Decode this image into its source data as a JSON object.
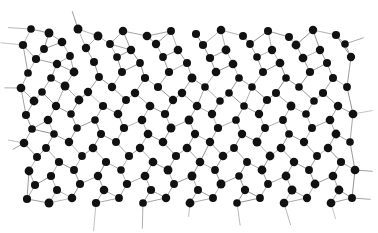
{
  "figure": {
    "kind": "structure-diagram",
    "caption": "",
    "background_color": "#ffffff",
    "atom_color": "#111111",
    "bond_color": "#8c8c8c",
    "atom_radius": 4.1,
    "bond_width": 0.75,
    "canvas": {
      "width": 378,
      "height": 233
    },
    "plot_area": {
      "x": 18,
      "y": 14,
      "width": 340,
      "height": 198
    },
    "atom_count": 196,
    "bond_count": 268,
    "mean_coordination": "3",
    "atoms": [
      [
        31,
        29
      ],
      [
        49,
        33
      ],
      [
        78,
        29
      ],
      [
        98,
        36
      ],
      [
        123,
        31
      ],
      [
        147,
        36
      ],
      [
        171,
        31
      ],
      [
        196,
        34
      ],
      [
        221,
        30
      ],
      [
        243,
        36
      ],
      [
        268,
        31
      ],
      [
        289,
        37
      ],
      [
        313,
        30
      ],
      [
        336,
        35
      ],
      [
        23,
        45
      ],
      [
        44,
        49
      ],
      [
        62,
        42
      ],
      [
        86,
        48
      ],
      [
        110,
        44
      ],
      [
        131,
        50
      ],
      [
        156,
        44
      ],
      [
        178,
        50
      ],
      [
        203,
        45
      ],
      [
        226,
        50
      ],
      [
        250,
        44
      ],
      [
        272,
        50
      ],
      [
        296,
        45
      ],
      [
        320,
        50
      ],
      [
        345,
        44
      ],
      [
        36,
        59
      ],
      [
        57,
        64
      ],
      [
        70,
        56
      ],
      [
        94,
        62
      ],
      [
        117,
        57
      ],
      [
        140,
        63
      ],
      [
        163,
        57
      ],
      [
        187,
        63
      ],
      [
        210,
        58
      ],
      [
        233,
        64
      ],
      [
        257,
        57
      ],
      [
        280,
        63
      ],
      [
        303,
        58
      ],
      [
        327,
        63
      ],
      [
        351,
        57
      ],
      [
        28,
        73
      ],
      [
        51,
        78
      ],
      [
        74,
        72
      ],
      [
        99,
        77
      ],
      [
        122,
        72
      ],
      [
        145,
        78
      ],
      [
        169,
        72
      ],
      [
        192,
        78
      ],
      [
        216,
        72
      ],
      [
        239,
        78
      ],
      [
        263,
        72
      ],
      [
        286,
        78
      ],
      [
        310,
        72
      ],
      [
        333,
        78
      ],
      [
        21,
        88
      ],
      [
        42,
        92
      ],
      [
        65,
        86
      ],
      [
        88,
        92
      ],
      [
        112,
        87
      ],
      [
        135,
        93
      ],
      [
        158,
        87
      ],
      [
        182,
        93
      ],
      [
        205,
        87
      ],
      [
        229,
        93
      ],
      [
        252,
        87
      ],
      [
        276,
        93
      ],
      [
        299,
        87
      ],
      [
        323,
        93
      ],
      [
        347,
        87
      ],
      [
        34,
        101
      ],
      [
        56,
        106
      ],
      [
        79,
        100
      ],
      [
        103,
        106
      ],
      [
        126,
        100
      ],
      [
        150,
        106
      ],
      [
        173,
        100
      ],
      [
        197,
        106
      ],
      [
        220,
        101
      ],
      [
        244,
        106
      ],
      [
        267,
        100
      ],
      [
        291,
        106
      ],
      [
        314,
        101
      ],
      [
        338,
        106
      ],
      [
        26,
        115
      ],
      [
        48,
        120
      ],
      [
        71,
        114
      ],
      [
        95,
        120
      ],
      [
        118,
        114
      ],
      [
        142,
        120
      ],
      [
        165,
        114
      ],
      [
        189,
        120
      ],
      [
        212,
        114
      ],
      [
        236,
        120
      ],
      [
        259,
        114
      ],
      [
        283,
        120
      ],
      [
        306,
        114
      ],
      [
        330,
        120
      ],
      [
        353,
        114
      ],
      [
        32,
        129
      ],
      [
        54,
        134
      ],
      [
        77,
        128
      ],
      [
        101,
        134
      ],
      [
        124,
        128
      ],
      [
        148,
        134
      ],
      [
        171,
        128
      ],
      [
        195,
        134
      ],
      [
        218,
        128
      ],
      [
        242,
        134
      ],
      [
        265,
        128
      ],
      [
        289,
        134
      ],
      [
        312,
        128
      ],
      [
        336,
        134
      ],
      [
        24,
        143
      ],
      [
        46,
        148
      ],
      [
        69,
        142
      ],
      [
        93,
        148
      ],
      [
        116,
        142
      ],
      [
        140,
        148
      ],
      [
        163,
        142
      ],
      [
        187,
        148
      ],
      [
        210,
        142
      ],
      [
        234,
        148
      ],
      [
        257,
        142
      ],
      [
        281,
        148
      ],
      [
        304,
        142
      ],
      [
        328,
        148
      ],
      [
        350,
        142
      ],
      [
        37,
        157
      ],
      [
        59,
        162
      ],
      [
        82,
        156
      ],
      [
        106,
        162
      ],
      [
        129,
        156
      ],
      [
        153,
        162
      ],
      [
        176,
        156
      ],
      [
        200,
        162
      ],
      [
        223,
        156
      ],
      [
        247,
        162
      ],
      [
        270,
        156
      ],
      [
        294,
        162
      ],
      [
        317,
        156
      ],
      [
        341,
        162
      ],
      [
        29,
        171
      ],
      [
        51,
        176
      ],
      [
        74,
        170
      ],
      [
        98,
        176
      ],
      [
        121,
        170
      ],
      [
        145,
        176
      ],
      [
        168,
        170
      ],
      [
        192,
        176
      ],
      [
        215,
        170
      ],
      [
        239,
        176
      ],
      [
        262,
        170
      ],
      [
        286,
        176
      ],
      [
        309,
        170
      ],
      [
        333,
        176
      ],
      [
        355,
        170
      ],
      [
        35,
        185
      ],
      [
        57,
        190
      ],
      [
        80,
        184
      ],
      [
        104,
        190
      ],
      [
        127,
        184
      ],
      [
        151,
        190
      ],
      [
        174,
        184
      ],
      [
        198,
        190
      ],
      [
        221,
        184
      ],
      [
        245,
        190
      ],
      [
        268,
        184
      ],
      [
        292,
        190
      ],
      [
        315,
        184
      ],
      [
        339,
        190
      ],
      [
        27,
        199
      ],
      [
        49,
        203
      ],
      [
        72,
        198
      ],
      [
        96,
        203
      ],
      [
        119,
        198
      ],
      [
        143,
        203
      ],
      [
        166,
        198
      ],
      [
        190,
        203
      ],
      [
        213,
        198
      ],
      [
        237,
        203
      ],
      [
        260,
        198
      ],
      [
        284,
        203
      ],
      [
        307,
        198
      ],
      [
        331,
        203
      ],
      [
        352,
        198
      ]
    ],
    "dangling_bonds": {
      "top": "bonds extend upward past the top row of atoms",
      "bottom": "bonds extend downward past the bottom row of atoms",
      "left": "bonds extend leftward past the leftmost atoms",
      "right": "bonds extend rightward past the rightmost atoms"
    }
  }
}
